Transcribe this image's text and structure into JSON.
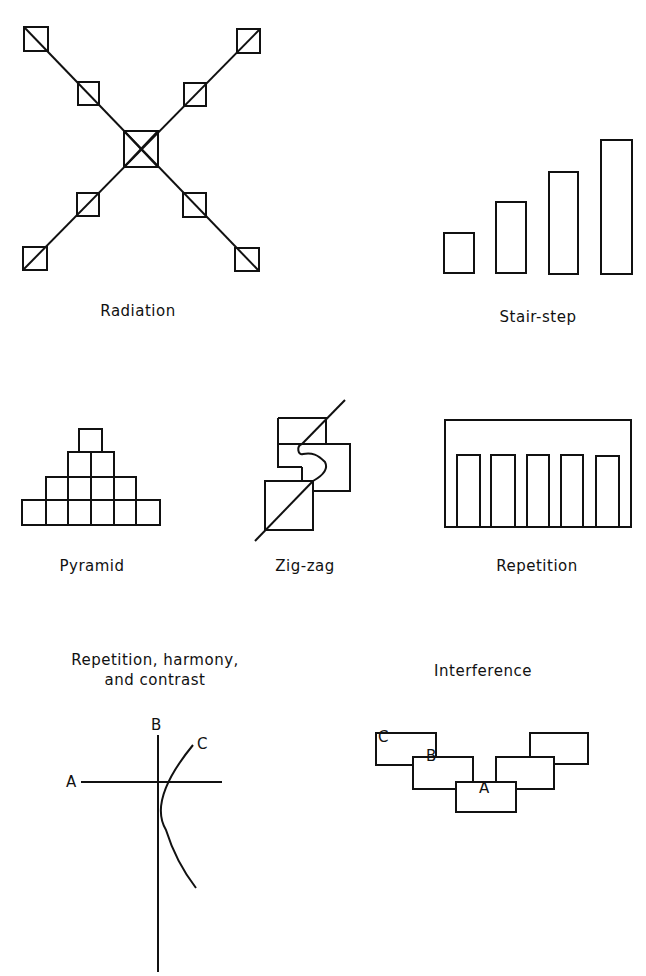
{
  "colors": {
    "ink": "#111111",
    "background": "#ffffff"
  },
  "panels": [
    {
      "id": "radiation",
      "label": "Radiation"
    },
    {
      "id": "stair-step",
      "label": "Stair-step"
    },
    {
      "id": "pyramid",
      "label": "Pyramid"
    },
    {
      "id": "zig-zag",
      "label": "Zig-zag"
    },
    {
      "id": "repetition",
      "label": "Repetition"
    },
    {
      "id": "repetition-harmony-contrast",
      "label_line1": "Repetition, harmony,",
      "label_line2": "and contrast",
      "letters": {
        "a": "A",
        "b": "B",
        "c": "C"
      }
    },
    {
      "id": "interference",
      "label": "Interference",
      "letters": {
        "a": "A",
        "b": "B",
        "c": "C"
      }
    }
  ]
}
